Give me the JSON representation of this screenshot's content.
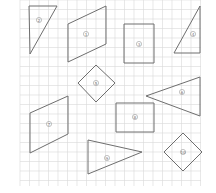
{
  "worksheet": {
    "grid": {
      "x0": 20,
      "y0": 0,
      "x1": 201,
      "y1": 186,
      "cell": 9.5,
      "color": "#d8d8d8"
    },
    "stroke_color": "#6e6e6e",
    "shapes": [
      {
        "id": 1,
        "type": "right-triangle",
        "label": "2",
        "points": [
          [
            29,
            6
          ],
          [
            57,
            6
          ],
          [
            30,
            54
          ]
        ],
        "label_pos": [
          39,
          20
        ]
      },
      {
        "id": 2,
        "type": "parallelogram",
        "label": "1",
        "points": [
          [
            68,
            24
          ],
          [
            106,
            6
          ],
          [
            106,
            44
          ],
          [
            68,
            62
          ]
        ],
        "label_pos": [
          86,
          34
        ]
      },
      {
        "id": 3,
        "type": "rectangle",
        "label": "3",
        "points": [
          [
            124,
            24
          ],
          [
            154,
            24
          ],
          [
            154,
            63
          ],
          [
            124,
            63
          ]
        ],
        "label_pos": [
          139,
          44
        ]
      },
      {
        "id": 4,
        "type": "right-triangle",
        "label": "4",
        "points": [
          [
            200,
            6
          ],
          [
            200,
            53
          ],
          [
            174,
            53
          ]
        ],
        "label_pos": [
          193,
          34
        ]
      },
      {
        "id": 5,
        "type": "square-diamond",
        "label": "5",
        "points": [
          [
            78,
            83
          ],
          [
            96,
            65
          ],
          [
            115,
            83
          ],
          [
            96,
            102
          ]
        ],
        "label_pos": [
          96,
          83
        ]
      },
      {
        "id": 6,
        "type": "triangle",
        "label": "6",
        "points": [
          [
            146,
            96
          ],
          [
            200,
            77
          ],
          [
            200,
            116
          ]
        ],
        "label_pos": [
          182,
          92
        ]
      },
      {
        "id": 7,
        "type": "parallelogram",
        "label": "7",
        "points": [
          [
            30,
            113
          ],
          [
            68,
            96
          ],
          [
            68,
            134
          ],
          [
            30,
            153
          ]
        ],
        "label_pos": [
          49,
          124
        ]
      },
      {
        "id": 8,
        "type": "rectangle",
        "label": "8",
        "points": [
          [
            116,
            103
          ],
          [
            154,
            103
          ],
          [
            154,
            132
          ],
          [
            116,
            132
          ]
        ],
        "label_pos": [
          135,
          117
        ]
      },
      {
        "id": 9,
        "type": "triangle",
        "label": "9",
        "points": [
          [
            88,
            140
          ],
          [
            142,
            152
          ],
          [
            88,
            174
          ]
        ],
        "label_pos": [
          107,
          158
        ]
      },
      {
        "id": 10,
        "type": "square-diamond",
        "label": "10",
        "points": [
          [
            164,
            152
          ],
          [
            183,
            133
          ],
          [
            202,
            152
          ],
          [
            183,
            171
          ]
        ],
        "label_pos": [
          183,
          152
        ]
      }
    ]
  }
}
